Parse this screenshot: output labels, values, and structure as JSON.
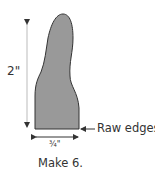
{
  "diagram": {
    "shape": {
      "name": "tall tapered pattern piece",
      "fill": "#999999",
      "stroke": "#333333"
    },
    "dimensions": {
      "height_label": "2\"",
      "width_label": "¾\""
    },
    "callouts": {
      "raw_edges": "Raw edges"
    },
    "instruction": "Make 6."
  }
}
